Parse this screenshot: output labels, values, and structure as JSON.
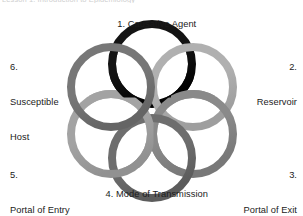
{
  "figure": {
    "top_fragment": "Lesson 1: Introduction to Epidemiology",
    "background_color": "#ffffff",
    "text_color": "#1b1b1b"
  },
  "chart_data": {
    "type": "diagram",
    "subtype": "interlocking-ring-cycle",
    "ring_count": 6,
    "layout": "six rings interlocked in a closed circular chain",
    "center": {
      "x": 152,
      "y": 111
    },
    "orbit_radius": 47,
    "ring_radius": 40,
    "ring_stroke_width": 8,
    "nodes": [
      {
        "number": "1.",
        "name": "Causative Agent",
        "label_full": "1. Causative Agent",
        "position": "top",
        "angle_deg": -90,
        "color": "#141414",
        "cx": 152,
        "cy": 64
      },
      {
        "number": "2.",
        "name": "Reservoir",
        "label_full": "2. Reservoir",
        "position": "upper-right",
        "angle_deg": -30,
        "color": "#b0b0b0",
        "cx": 193,
        "cy": 87
      },
      {
        "number": "3.",
        "name": "Portal of Exit",
        "label_full": "3. Portal of Exit",
        "position": "lower-right",
        "angle_deg": 30,
        "color": "#8a8a8a",
        "cx": 193,
        "cy": 134
      },
      {
        "number": "4.",
        "name": "Mode of Transmission",
        "label_full": "4. Mode of Transmission",
        "position": "bottom",
        "angle_deg": 90,
        "color": "#6e6e6e",
        "cx": 152,
        "cy": 158
      },
      {
        "number": "5.",
        "name": "Portal of Entry",
        "label_full": "5. Portal of Entry",
        "position": "lower-left",
        "angle_deg": 150,
        "color": "#a3a3a3",
        "cx": 111,
        "cy": 134
      },
      {
        "number": "6.",
        "name": "Susceptible Host",
        "label_full": "6. Susceptible Host",
        "position": "upper-left",
        "angle_deg": -150,
        "color": "#777777",
        "cx": 111,
        "cy": 87
      }
    ]
  },
  "labels": {
    "causative_agent": {
      "number": "1.",
      "text": "Causative Agent",
      "full": "1. Causative Agent"
    },
    "reservoir": {
      "number": "2.",
      "text": "Reservoir"
    },
    "portal_of_exit": {
      "number": "3.",
      "text": "Portal of Exit"
    },
    "mode_of_transmission": {
      "number": "4.",
      "text": "Mode of Transmission",
      "full": "4. Mode of Transmission"
    },
    "portal_of_entry": {
      "number": "5.",
      "text": "Portal of Entry"
    },
    "susceptible_host": {
      "number": "6.",
      "text_line1": "Susceptible",
      "text_line2": "Host"
    }
  }
}
